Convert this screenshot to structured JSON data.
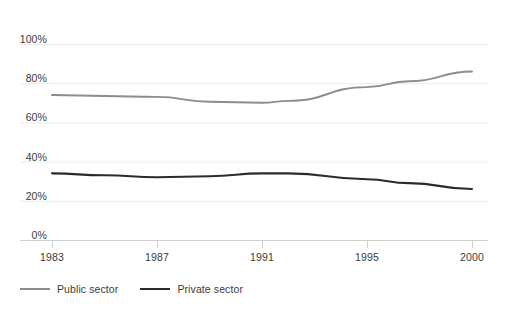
{
  "chart_data": {
    "type": "line",
    "title": "",
    "subtitle": "",
    "xlabel": "",
    "ylabel": "",
    "x": [
      1983,
      1987,
      1991,
      1995,
      2000
    ],
    "categories": [
      "1983",
      "1987",
      "1991",
      "1995",
      "2000"
    ],
    "x_tick_labels": [
      "1983",
      "1987",
      "1991",
      "1995",
      "2000"
    ],
    "y_tick_labels": [
      "0%",
      "20%",
      "40%",
      "60%",
      "80%",
      "100%"
    ],
    "y_tick_values": [
      0,
      20,
      40,
      60,
      80,
      100
    ],
    "ylim": [
      0,
      100
    ],
    "xlim": [
      1983,
      2000
    ],
    "grid": true,
    "grid_axis": "y",
    "legend_position": "bottom-left",
    "series": [
      {
        "name": "Public sector",
        "color": "#8c8c8c",
        "values": [
          74,
          73,
          70,
          78,
          86
        ],
        "points": [
          {
            "x": 1983,
            "y": 74
          },
          {
            "x": 1985,
            "y": 73.5
          },
          {
            "x": 1987,
            "y": 73
          },
          {
            "x": 1989,
            "y": 70.5
          },
          {
            "x": 1991,
            "y": 70
          },
          {
            "x": 1992,
            "y": 71
          },
          {
            "x": 1995,
            "y": 78
          },
          {
            "x": 1997,
            "y": 81
          },
          {
            "x": 2000,
            "y": 86
          }
        ]
      },
      {
        "name": "Private sector",
        "color": "#2b2b2b",
        "values": [
          34,
          32,
          34,
          31,
          26
        ],
        "points": [
          {
            "x": 1983,
            "y": 34
          },
          {
            "x": 1985,
            "y": 33
          },
          {
            "x": 1987,
            "y": 32
          },
          {
            "x": 1989,
            "y": 32.5
          },
          {
            "x": 1991,
            "y": 34
          },
          {
            "x": 1992,
            "y": 34
          },
          {
            "x": 1995,
            "y": 31
          },
          {
            "x": 1997,
            "y": 29
          },
          {
            "x": 2000,
            "y": 26
          }
        ]
      }
    ]
  },
  "legend": {
    "entries": [
      {
        "label": "Public sector",
        "color": "#8c8c8c"
      },
      {
        "label": "Private sector",
        "color": "#2b2b2b"
      }
    ]
  },
  "axes": {
    "y_labels": [
      "100%",
      "80%",
      "60%",
      "40%",
      "20%",
      "0%"
    ],
    "x_labels": [
      "1983",
      "1987",
      "1991",
      "1995",
      "2000"
    ]
  },
  "colors": {
    "background": "#ffffff",
    "gridline": "#ebebeb",
    "axis": "#d0d0d0",
    "text": "#3b3b3b",
    "public_sector": "#8c8c8c",
    "private_sector": "#2b2b2b"
  }
}
